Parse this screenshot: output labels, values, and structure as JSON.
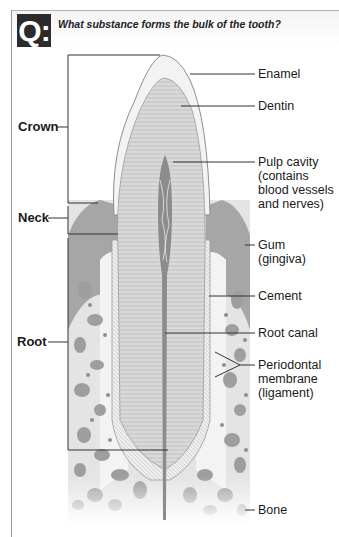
{
  "question": {
    "badge": "Q:",
    "text": "What substance forms the bulk of the tooth?"
  },
  "regions": [
    {
      "label": "Crown"
    },
    {
      "label": "Neck"
    },
    {
      "label": "Root"
    }
  ],
  "labels": [
    {
      "label": "Enamel"
    },
    {
      "label": "Dentin"
    },
    {
      "label": "Pulp cavity\n(contains\nblood vessels\nand nerves)",
      "lines": [
        "Pulp cavity",
        "(contains",
        "blood vessels",
        "and nerves)"
      ]
    },
    {
      "label": "Gum (gingiva)",
      "lines": [
        "Gum",
        "(gingiva)"
      ]
    },
    {
      "label": "Cement"
    },
    {
      "label": "Root canal"
    },
    {
      "label": "Periodontal membrane (ligament)",
      "lines": [
        "Periodontal",
        "membrane",
        "(ligament)"
      ]
    },
    {
      "label": "Bone"
    }
  ],
  "colors": {
    "badge_bg": "#2b2b2b",
    "enamel": "#f2f2f2",
    "dentin": "#d6d6d6",
    "pulp": "#8a8a8a",
    "gum": "#a9a9a9",
    "bone": "#e6e6e6",
    "bone_spots": "#9c9c9c"
  }
}
